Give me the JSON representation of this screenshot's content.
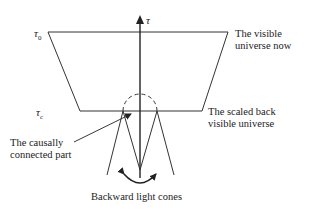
{
  "diagram": {
    "axis_label": "τ",
    "tau_now_label": "τ",
    "tau_now_subscript": "0",
    "tau_c_label": "τ",
    "tau_c_subscript": "c",
    "visible_universe_now": {
      "line1": "The visible",
      "line2": "universe now"
    },
    "scaled_back_universe": {
      "line1": "The scaled back",
      "line2": "visible universe"
    },
    "causally_connected": {
      "line1": "The causally",
      "line2": "connected part"
    },
    "backward_light_cones": "Backward light cones",
    "colors": {
      "line": "#333333",
      "background": "#ffffff"
    }
  }
}
